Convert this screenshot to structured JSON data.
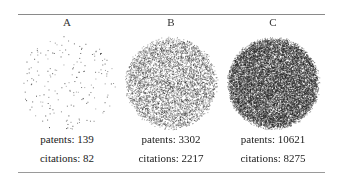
{
  "panels": [
    {
      "label": "A",
      "patents_label": "patents: 139",
      "citations_label": "citations: 82",
      "patents": 139,
      "citations": 82,
      "density": "sparse"
    },
    {
      "label": "B",
      "patents_label": "patents: 3302",
      "citations_label": "citations: 2217",
      "patents": 3302,
      "citations": 2217,
      "density": "medium"
    },
    {
      "label": "C",
      "patents_label": "patents: 10621",
      "citations_label": "citations: 8275",
      "patents": 10621,
      "citations": 8275,
      "density": "dense"
    }
  ],
  "colors": {
    "dot": "#1a1a1a",
    "rule": "#8a8a8a"
  }
}
